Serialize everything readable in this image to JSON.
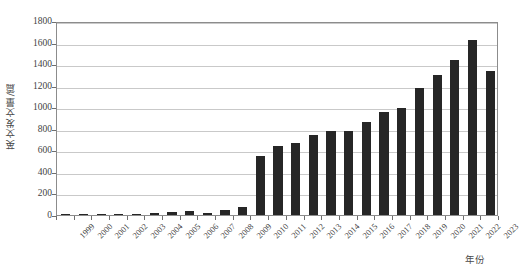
{
  "chart_data": {
    "type": "bar",
    "title": "",
    "subtitle": "",
    "xlabel": "年份",
    "ylabel": "英文发文量/篇",
    "categories": [
      "1999",
      "2000",
      "2001",
      "2002",
      "2003",
      "2004",
      "2005",
      "2006",
      "2007",
      "2008",
      "2009",
      "2010",
      "2011",
      "2012",
      "2013",
      "2014",
      "2015",
      "2016",
      "2017",
      "2018",
      "2019",
      "2020",
      "2021",
      "2022",
      "2023"
    ],
    "values": [
      3,
      5,
      4,
      3,
      10,
      20,
      30,
      35,
      22,
      50,
      78,
      545,
      640,
      665,
      740,
      775,
      780,
      865,
      960,
      995,
      1180,
      1300,
      1440,
      1620,
      1340
    ],
    "ylim": [
      0,
      1800
    ],
    "ytick_values": [
      0,
      200,
      400,
      600,
      800,
      1000,
      1200,
      1400,
      1600,
      1800
    ],
    "ytick_labels": [
      "0",
      "200",
      "400",
      "600",
      "800",
      "1000",
      "1200",
      "1400",
      "1600",
      "1800"
    ],
    "grid": true,
    "legend": false,
    "legend_position": "none",
    "bar_color": "#262626",
    "grid_color": "#c9c9c9",
    "axis_color": "#8c8c8c",
    "background_color": "#ffffff"
  }
}
